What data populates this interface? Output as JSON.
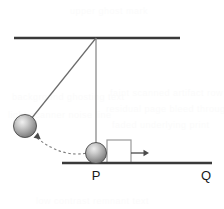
{
  "figure": {
    "type": "physics-diagram",
    "canvas": {
      "width": 224,
      "height": 209,
      "background": "#ffffff"
    },
    "colors": {
      "ceiling": "#3a3a3a",
      "ground": "#3a3a3a",
      "string": "#6b6b6b",
      "rod": "#8a8a8a",
      "ball_light": "#e2e2e2",
      "ball_mid": "#a8a8a8",
      "ball_dark": "#5c5c5c",
      "ball_outline": "#4a4a4a",
      "box_fill": "#ffffff",
      "box_stroke": "#9a9a9a",
      "arrow": "#4a4a4a",
      "trajectory": "#7d7d7d",
      "label": "#1a1a1a",
      "watermark": "#fbfbfb"
    },
    "ceiling": {
      "x1": 14,
      "y1": 38,
      "x2": 180,
      "y2": 38,
      "stroke_width": 2.4
    },
    "ground": {
      "x1": 62,
      "y1": 163,
      "x2": 212,
      "y2": 163,
      "stroke_width": 2.4
    },
    "pivot": {
      "x": 96,
      "y": 38
    },
    "vertical_rod": {
      "x1": 96,
      "y1": 38,
      "x2": 96,
      "y2": 146,
      "stroke_width": 1.3
    },
    "string": {
      "x1": 96,
      "y1": 38,
      "x2": 27,
      "y2": 124,
      "stroke_width": 1.2
    },
    "raised_ball": {
      "cx": 25,
      "cy": 126,
      "r": 11.5
    },
    "resting_ball": {
      "cx": 96,
      "cy": 153,
      "r": 10.5
    },
    "swing_arrowhead": {
      "x": 38,
      "y": 137,
      "angle_deg": 40
    },
    "trajectory_arc": {
      "start_x": 37,
      "start_y": 138,
      "ctrl_x": 62,
      "ctrl_y": 158,
      "end_x": 87,
      "end_y": 153,
      "dash": "2.5 2.5",
      "stroke_width": 1.1
    },
    "box": {
      "x": 107,
      "y": 140,
      "width": 24,
      "height": 23,
      "stroke_width": 1.2
    },
    "motion_arrow": {
      "x1": 131,
      "y1": 153,
      "x2": 149,
      "y2": 153,
      "stroke_width": 1.3
    },
    "labels": [
      {
        "name": "point-p",
        "text": "P",
        "x": 96,
        "y": 180
      },
      {
        "name": "point-q",
        "text": "Q",
        "x": 206,
        "y": 180
      }
    ],
    "watermarks": [
      {
        "text": "background ghosting text",
        "left": 12,
        "top": 92
      },
      {
        "text": "faint scanned artifact row",
        "left": 110,
        "top": 88
      },
      {
        "text": "residual page bleed through",
        "left": 106,
        "top": 104
      },
      {
        "text": "light scanner noise line",
        "left": 8,
        "top": 110
      },
      {
        "text": "faded underlying print",
        "left": 112,
        "top": 120
      },
      {
        "text": "low contrast remnant text",
        "left": 36,
        "top": 196
      },
      {
        "text": "upper ghost mark",
        "left": 70,
        "top": 6
      }
    ]
  }
}
